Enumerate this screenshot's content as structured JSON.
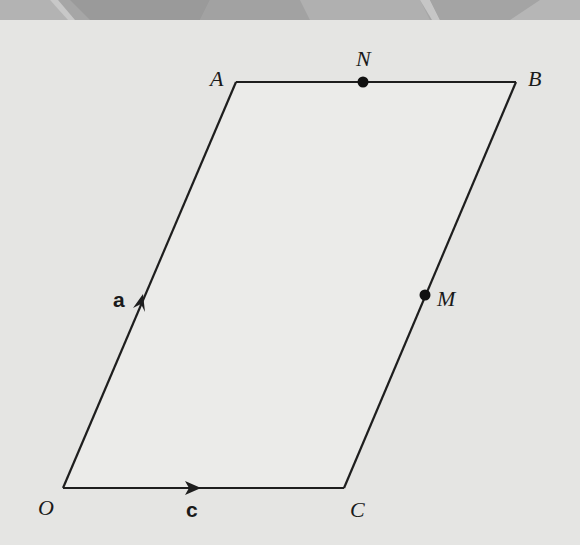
{
  "diagram": {
    "type": "parallelogram-vectors",
    "colors": {
      "background": "#e5e5e3",
      "fill": "#ebebe9",
      "stroke": "#1e1e1e",
      "banner": "#a9a9a9"
    },
    "vertices": {
      "O": {
        "label": "O",
        "x": 63,
        "y": 488
      },
      "A": {
        "label": "A",
        "x": 236,
        "y": 82
      },
      "B": {
        "label": "B",
        "x": 516,
        "y": 82
      },
      "C": {
        "label": "C",
        "x": 344,
        "y": 488
      }
    },
    "points": {
      "N": {
        "label": "N",
        "x": 363,
        "y": 82,
        "on": "AB"
      },
      "M": {
        "label": "M",
        "x": 425,
        "y": 295,
        "on": "BC"
      }
    },
    "vectors": [
      {
        "name": "a",
        "label": "a",
        "from": "O",
        "to": "A"
      },
      {
        "name": "c",
        "label": "c",
        "from": "O",
        "to": "C"
      }
    ]
  }
}
